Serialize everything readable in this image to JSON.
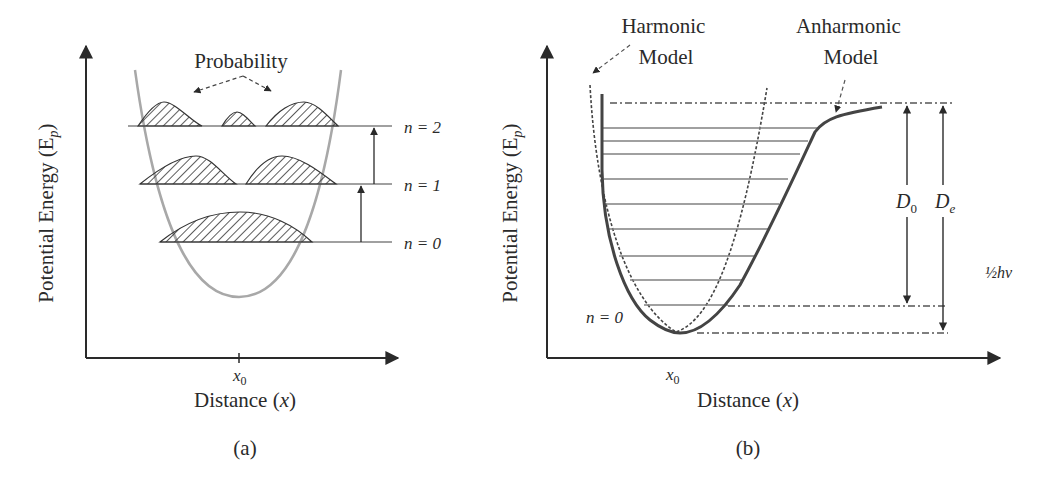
{
  "figure": {
    "panel_a": {
      "caption": "(a)",
      "y_axis_label": "Potential Energy (E",
      "y_axis_label_sub": "p",
      "y_axis_label_close": ")",
      "x_axis_label": "Distance (",
      "x_axis_label_var": "x",
      "x_axis_label_close": ")",
      "x_tick_label": "x",
      "x_tick_sub": "0",
      "probability_label": "Probability",
      "levels": [
        {
          "label": "n = 2"
        },
        {
          "label": "n = 1"
        },
        {
          "label": "n = 0"
        }
      ]
    },
    "panel_b": {
      "caption": "(b)",
      "y_axis_label": "Potential Energy (E",
      "y_axis_label_sub": "p",
      "y_axis_label_close": ")",
      "x_axis_label": "Distance (",
      "x_axis_label_var": "x",
      "x_axis_label_close": ")",
      "x_tick_label": "x",
      "x_tick_sub": "0",
      "harmonic_label_line1": "Harmonic",
      "harmonic_label_line2": "Model",
      "anharmonic_label_line1": "Anharmonic",
      "anharmonic_label_line2": "Model",
      "ground_level_label": "n = 0",
      "d0_label": "D",
      "d0_sub": "0",
      "de_label": "D",
      "de_sub": "e",
      "zero_point_label": "½hν"
    }
  },
  "colors": {
    "axis": "#2a2a2a",
    "parabola_a": "#a8a8a8",
    "level_line": "#808080",
    "morse_curve": "#444444",
    "hatch": "#333333"
  }
}
